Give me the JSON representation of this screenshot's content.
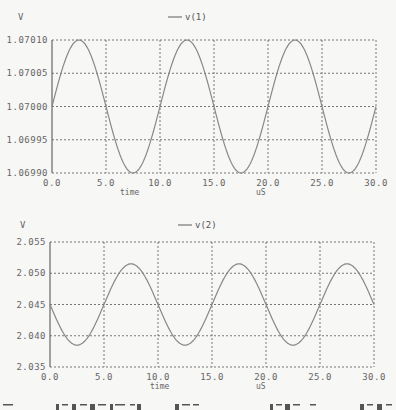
{
  "chart_data": [
    {
      "type": "line",
      "title": "",
      "legend": [
        "v(1)"
      ],
      "legend_position": "top-center",
      "ylabel": "V",
      "xlabel": "time",
      "xunit": "uS",
      "xlim": [
        0,
        30
      ],
      "ylim": [
        1.0699,
        1.0701
      ],
      "grid": true,
      "x_ticks": [
        "0.0",
        "5.0",
        "10.0",
        "15.0",
        "20.0",
        "25.0",
        "30.0"
      ],
      "y_ticks": [
        "1.06990",
        "1.06995",
        "1.07000",
        "1.07005",
        "1.07010"
      ],
      "series": [
        {
          "name": "v(1)",
          "description": "sine, offset 1.07000 V, amplitude 0.00010 V, period 10 uS, starts rising at t=0",
          "x": [
            0,
            2.5,
            5,
            7.5,
            10,
            12.5,
            15,
            17.5,
            20,
            22.5,
            25,
            27.5,
            30
          ],
          "values": [
            1.07,
            1.0701,
            1.07,
            1.0699,
            1.07,
            1.0701,
            1.07,
            1.0699,
            1.07,
            1.0701,
            1.07,
            1.0699,
            1.07
          ]
        }
      ]
    },
    {
      "type": "line",
      "title": "",
      "legend": [
        "v(2)"
      ],
      "legend_position": "top-center",
      "ylabel": "V",
      "xlabel": "time",
      "xunit": "uS",
      "xlim": [
        0,
        30
      ],
      "ylim": [
        2.035,
        2.055
      ],
      "grid": true,
      "x_ticks": [
        "0.0",
        "5.0",
        "10.0",
        "15.0",
        "20.0",
        "25.0",
        "30.0"
      ],
      "y_ticks": [
        "2.035",
        "2.040",
        "2.045",
        "2.050",
        "2.055"
      ],
      "series": [
        {
          "name": "v(2)",
          "description": "sine, offset 2.045 V, amplitude ~0.0065 V, period 10 uS, starts falling at t=0",
          "x": [
            0,
            2.5,
            5,
            7.5,
            10,
            12.5,
            15,
            17.5,
            20,
            22.5,
            25,
            27.5,
            30
          ],
          "values": [
            2.045,
            2.0385,
            2.045,
            2.0515,
            2.045,
            2.0385,
            2.045,
            2.0515,
            2.045,
            2.0385,
            2.045,
            2.0515,
            2.045
          ]
        }
      ]
    }
  ],
  "charts": [
    {
      "y_unit": "V",
      "legend_label": "v(1)",
      "x_axis_name": "time",
      "x_axis_unit": "uS",
      "plot": {
        "left": 52,
        "top": 40,
        "right": 376,
        "bottom": 173
      },
      "y_min": 1.0699,
      "y_max": 1.0701,
      "offset": 1.07,
      "amp": 0.0001,
      "sign": 1,
      "y_tick_labels": [
        "1.07010",
        "1.07005",
        "1.07000",
        "1.06995",
        "1.06990"
      ],
      "x_tick_labels": [
        "0.0",
        "5.0",
        "10.0",
        "15.0",
        "20.0",
        "25.0",
        "30.0"
      ]
    },
    {
      "y_unit": "V",
      "legend_label": "v(2)",
      "x_axis_name": "time",
      "x_axis_unit": "uS",
      "plot": {
        "left": 50,
        "top": 37,
        "right": 374,
        "bottom": 162
      },
      "y_min": 2.035,
      "y_max": 2.055,
      "offset": 2.045,
      "amp": 0.0065,
      "sign": -1,
      "y_tick_labels": [
        "2.055",
        "2.050",
        "2.045",
        "2.040",
        "2.035"
      ],
      "x_tick_labels": [
        "0.0",
        "5.0",
        "10.0",
        "15.0",
        "20.0",
        "25.0",
        "30.0"
      ]
    }
  ],
  "colors": {
    "trace": "#888888",
    "grid": "#777777",
    "axis": "#666666",
    "background": "#f7f7f5"
  }
}
